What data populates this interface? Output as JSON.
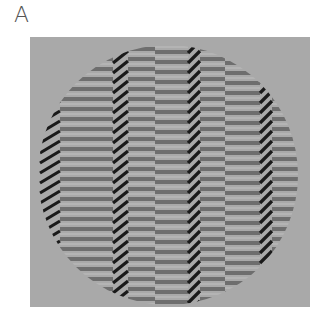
{
  "figure": {
    "panel_label": "A",
    "colors": {
      "background": "#a9a9a9",
      "dark_bar": "#6e6e6e",
      "light_bar": "#b4b4b4",
      "diagonal_stripe": "#1a1a1a"
    },
    "circle": {
      "cx": 138,
      "cy": 138,
      "r": 130
    },
    "bar_period": 10,
    "bar_thickness": 4,
    "columns": [
      {
        "x0": 10,
        "x1": 30,
        "type": "diagonal"
      },
      {
        "x0": 30,
        "x1": 83,
        "type": "bars",
        "phase": 0
      },
      {
        "x0": 83,
        "x1": 98,
        "type": "diagonal"
      },
      {
        "x0": 98,
        "x1": 125,
        "type": "bars",
        "phase": 0
      },
      {
        "x0": 125,
        "x1": 158,
        "type": "bars",
        "phase": 3
      },
      {
        "x0": 158,
        "x1": 170,
        "type": "diagonal"
      },
      {
        "x0": 170,
        "x1": 195,
        "type": "bars",
        "phase": 0
      },
      {
        "x0": 195,
        "x1": 230,
        "type": "bars",
        "phase": 4
      },
      {
        "x0": 230,
        "x1": 242,
        "type": "diagonal"
      },
      {
        "x0": 242,
        "x1": 270,
        "type": "bars",
        "phase": 0
      }
    ]
  }
}
